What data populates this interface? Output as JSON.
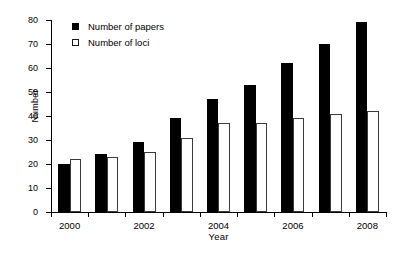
{
  "chart_data": {
    "type": "bar",
    "title": "",
    "subtitle": "",
    "xlabel": "Year",
    "ylabel": "Number",
    "categories": [
      "2000",
      "2001",
      "2002",
      "2003",
      "2004",
      "2005",
      "2006",
      "2007",
      "2008"
    ],
    "xtick_labels_shown": [
      "2000",
      "2002",
      "2004",
      "2006",
      "2008"
    ],
    "series": [
      {
        "name": "Number of papers",
        "color": "#000000",
        "style": "filled",
        "values": [
          20,
          24,
          29,
          39,
          47,
          53,
          62,
          70,
          79
        ]
      },
      {
        "name": "Number of loci",
        "color": "#ffffff",
        "style": "open",
        "values": [
          22,
          23,
          25,
          31,
          37,
          37,
          39,
          41,
          42
        ]
      }
    ],
    "ylim": [
      0,
      80
    ],
    "ytick_values": [
      0,
      10,
      20,
      30,
      40,
      50,
      60,
      70,
      80
    ],
    "grid": false,
    "legend_position": "top-left",
    "bar_orientation": "vertical",
    "frame": "left-bottom-spines"
  },
  "legend": {
    "entries": [
      {
        "label": "Number of papers",
        "swatch": "filled-square-icon"
      },
      {
        "label": "Number of loci",
        "swatch": "open-square-icon"
      }
    ]
  },
  "axes": {
    "y_title": "Number",
    "x_title": "Year"
  }
}
